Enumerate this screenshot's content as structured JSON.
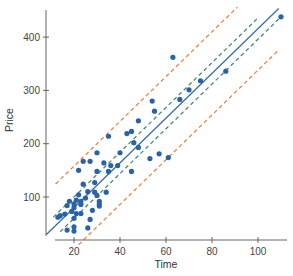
{
  "chart_data": {
    "type": "scatter",
    "title": "",
    "xlabel": "Time",
    "ylabel": "Price",
    "xlim": [
      9,
      112
    ],
    "ylim": [
      30,
      455
    ],
    "xticks": [
      20,
      40,
      60,
      80,
      100
    ],
    "yticks": [
      100,
      200,
      300,
      400
    ],
    "grid": false,
    "legend": null,
    "points": [
      {
        "x": 110,
        "y": 438
      },
      {
        "x": 63,
        "y": 362
      },
      {
        "x": 86,
        "y": 336
      },
      {
        "x": 75,
        "y": 318
      },
      {
        "x": 70,
        "y": 301
      },
      {
        "x": 66,
        "y": 283
      },
      {
        "x": 55,
        "y": 261
      },
      {
        "x": 54,
        "y": 280
      },
      {
        "x": 48,
        "y": 243
      },
      {
        "x": 43,
        "y": 219
      },
      {
        "x": 45,
        "y": 223
      },
      {
        "x": 46,
        "y": 202
      },
      {
        "x": 48,
        "y": 193
      },
      {
        "x": 61,
        "y": 174
      },
      {
        "x": 53,
        "y": 172
      },
      {
        "x": 57,
        "y": 181
      },
      {
        "x": 35,
        "y": 214
      },
      {
        "x": 40,
        "y": 183
      },
      {
        "x": 30,
        "y": 183
      },
      {
        "x": 33,
        "y": 164
      },
      {
        "x": 24,
        "y": 167
      },
      {
        "x": 27,
        "y": 167
      },
      {
        "x": 30,
        "y": 148
      },
      {
        "x": 36,
        "y": 159
      },
      {
        "x": 39,
        "y": 159
      },
      {
        "x": 35,
        "y": 148
      },
      {
        "x": 45,
        "y": 148
      },
      {
        "x": 29,
        "y": 127
      },
      {
        "x": 22,
        "y": 150
      },
      {
        "x": 24,
        "y": 124
      },
      {
        "x": 29,
        "y": 109
      },
      {
        "x": 30,
        "y": 103
      },
      {
        "x": 26,
        "y": 110
      },
      {
        "x": 25,
        "y": 98
      },
      {
        "x": 23,
        "y": 92
      },
      {
        "x": 22,
        "y": 104
      },
      {
        "x": 34,
        "y": 109
      },
      {
        "x": 31,
        "y": 92
      },
      {
        "x": 31,
        "y": 87
      },
      {
        "x": 21,
        "y": 94
      },
      {
        "x": 18,
        "y": 92
      },
      {
        "x": 23,
        "y": 86
      },
      {
        "x": 20,
        "y": 87
      },
      {
        "x": 17,
        "y": 84
      },
      {
        "x": 20,
        "y": 80
      },
      {
        "x": 28,
        "y": 75
      },
      {
        "x": 19,
        "y": 73
      },
      {
        "x": 21,
        "y": 69
      },
      {
        "x": 16,
        "y": 68
      },
      {
        "x": 14,
        "y": 65
      },
      {
        "x": 23,
        "y": 69
      },
      {
        "x": 31,
        "y": 83
      },
      {
        "x": 27,
        "y": 58
      },
      {
        "x": 20,
        "y": 60
      },
      {
        "x": 13,
        "y": 62
      },
      {
        "x": 17,
        "y": 38
      },
      {
        "x": 20,
        "y": 36
      },
      {
        "x": 20,
        "y": 44
      },
      {
        "x": 26,
        "y": 42
      }
    ],
    "regression_line": {
      "intercept": -4,
      "slope": 4.2,
      "x_range": [
        8,
        109
      ],
      "color": "#3a6ea5",
      "style": "solid"
    },
    "confidence_band": {
      "offset": 20,
      "x_range_upper": [
        11,
        100
      ],
      "x_range_lower": [
        14,
        109
      ],
      "color": "#4a8a78",
      "style": "dashed"
    },
    "prediction_band": {
      "offset": 78,
      "x_range_upper": [
        12,
        91
      ],
      "x_range_lower": [
        22,
        109
      ],
      "color": "#e8864a",
      "style": "dashed"
    },
    "colors": {
      "points": "#2a62a8",
      "axis": "#555555"
    }
  }
}
